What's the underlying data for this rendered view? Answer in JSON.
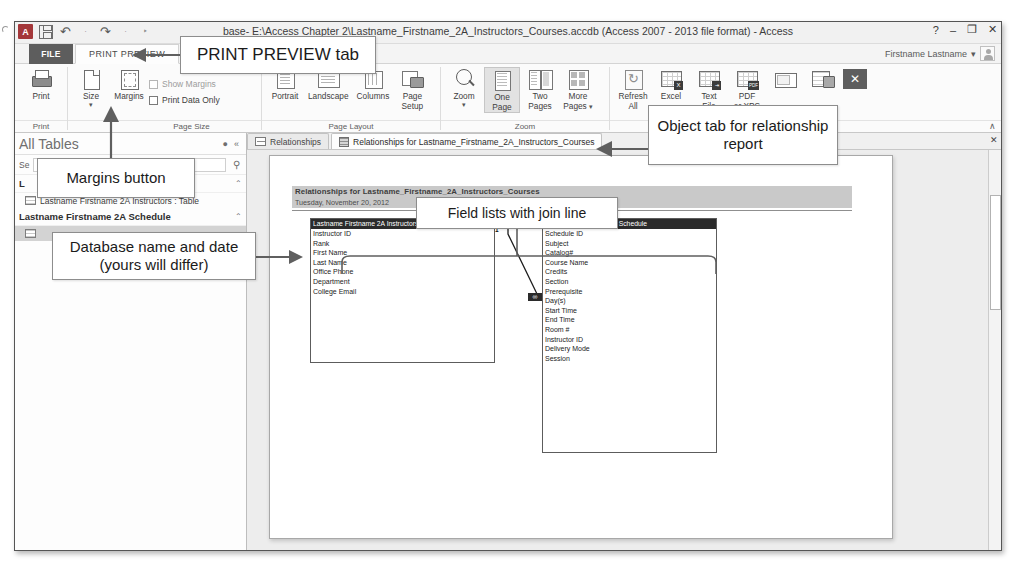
{
  "window": {
    "title": "base- E:\\Access Chapter 2\\Lastname_Firstname_2A_Instructors_Courses.accdb (Access 2007 - 2013 file format) - Access",
    "help": "?",
    "minimize": "–",
    "restore": "❐",
    "close": "✕",
    "user_name": "Firstname Lastname",
    "user_caret": "▾",
    "quick_access": {
      "app_logo": "A",
      "undo": "↶",
      "redo": "↷",
      "customize": "‣"
    }
  },
  "ribbon": {
    "file_tab": "FILE",
    "active_tab": "PRINT PREVIEW",
    "collapse": "∧",
    "groups": [
      {
        "label": "Print",
        "buttons": [
          {
            "label": "Print",
            "label2": "",
            "icon": "printer-icon"
          }
        ]
      },
      {
        "label": "Page Size",
        "buttons": [
          {
            "label": "Size",
            "label2": "",
            "icon": "page-size-icon",
            "caret": "▾"
          },
          {
            "label": "Margins",
            "label2": "",
            "icon": "margins-icon"
          }
        ],
        "checkboxes": [
          {
            "label": "Show Margins",
            "checked": false
          },
          {
            "label": "Print Data Only",
            "checked": false
          }
        ]
      },
      {
        "label": "Page Layout",
        "buttons": [
          {
            "label": "Portrait",
            "label2": "",
            "icon": "portrait-icon"
          },
          {
            "label": "Landscape",
            "label2": "",
            "icon": "landscape-icon"
          },
          {
            "label": "Columns",
            "label2": "",
            "icon": "columns-icon"
          },
          {
            "label": "Page",
            "label2": "Setup",
            "icon": "page-setup-icon"
          }
        ]
      },
      {
        "label": "Zoom",
        "buttons": [
          {
            "label": "Zoom",
            "label2": "",
            "icon": "magnifier-icon",
            "caret": "▾"
          },
          {
            "label": "One",
            "label2": "Page",
            "icon": "one-page-icon"
          },
          {
            "label": "Two",
            "label2": "Pages",
            "icon": "two-pages-icon"
          },
          {
            "label": "More",
            "label2": "Pages",
            "icon": "more-pages-icon",
            "caret": "▾"
          }
        ]
      },
      {
        "label": "Data",
        "buttons": [
          {
            "label": "Refresh",
            "label2": "All",
            "icon": "refresh-icon"
          },
          {
            "label": "Excel",
            "label2": "",
            "icon": "excel-export-icon",
            "badge": "X"
          },
          {
            "label": "Text",
            "label2": "File",
            "icon": "text-file-export-icon",
            "badge": "⬚"
          },
          {
            "label": "PDF",
            "label2": "or XPS",
            "icon": "pdf-xps-export-icon",
            "badge": "PDF"
          },
          {
            "label": "",
            "label2": "",
            "icon": "email-export-icon"
          },
          {
            "label": "",
            "label2": "",
            "icon": "more-export-icon"
          }
        ],
        "close_preview": "✕"
      }
    ]
  },
  "nav_pane": {
    "title": "All Tables",
    "options_icon": "●",
    "collapse_icon": "«",
    "search_label": "Se",
    "search_value": "",
    "search_placeholder": "les",
    "search_icon": "⚲",
    "groups": [
      {
        "name": "L",
        "expand": "⌃",
        "items": [
          {
            "label": "Lastname Firstname 2A Instructors : Table",
            "icon": "table-icon",
            "selected": false
          }
        ]
      },
      {
        "name": "Lastname Firstname 2A Schedule",
        "expand": "⌃",
        "items": [
          {
            "label": "",
            "icon": "table-icon",
            "selected": true
          }
        ]
      }
    ]
  },
  "object_tabs": [
    {
      "label": "Relationships",
      "icon": "relationships-icon",
      "active": false
    },
    {
      "label": "Relationships for Lastname_Firstname_2A_Instructors_Courses",
      "icon": "report-icon",
      "active": true
    }
  ],
  "report": {
    "title": "Relationships for Lastname_Firstname_2A_Instructors_Courses",
    "date": "Tuesday, November 20, 2012",
    "field_lists": [
      {
        "name": "table-instructors",
        "header": "Lastname Firstname 2A Instructors",
        "fields": [
          "Instructor ID",
          "Rank",
          "First Name",
          "Last Name",
          "Office Phone",
          "Department",
          "College Email"
        ]
      },
      {
        "name": "table-schedule",
        "header": "Lastname Firstname 2A Schedule",
        "fields": [
          "Schedule ID",
          "Subject",
          "Catalog#",
          "Course Name",
          "Credits",
          "Section",
          "Prerequisite",
          "Day(s)",
          "Start Time",
          "End Time",
          "Room #",
          "Instructor ID",
          "Delivery Mode",
          "Session"
        ]
      }
    ],
    "join": {
      "one_label": "1",
      "many_label": "∞"
    }
  },
  "scrollbar": {
    "up": "▴",
    "down": "▾"
  },
  "document_close": "✕",
  "callouts": {
    "print_preview_tab": "PRINT PREVIEW tab",
    "margins_button": "Margins button",
    "database_name_date": "Database name and date (yours will differ)",
    "field_lists": "Field lists with join line",
    "object_tab": "Object tab for relationship report"
  }
}
